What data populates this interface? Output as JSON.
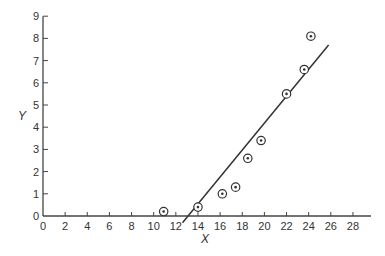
{
  "chart_data": {
    "type": "scatter",
    "title": "",
    "xlabel": "X",
    "ylabel": "Y",
    "xlim": [
      0,
      30
    ],
    "ylim": [
      0,
      9
    ],
    "xticks": [
      0,
      2,
      4,
      6,
      8,
      10,
      12,
      14,
      16,
      18,
      20,
      22,
      24,
      26,
      28
    ],
    "yticks": [
      0,
      1,
      2,
      3,
      4,
      5,
      6,
      7,
      8,
      9
    ],
    "grid": false,
    "legend": null,
    "series": [
      {
        "name": "data points",
        "marker": "circled-dot",
        "points": [
          {
            "x": 10.9,
            "y": 0.2
          },
          {
            "x": 14.0,
            "y": 0.4
          },
          {
            "x": 16.2,
            "y": 1.0
          },
          {
            "x": 17.4,
            "y": 1.3
          },
          {
            "x": 18.5,
            "y": 2.6
          },
          {
            "x": 19.7,
            "y": 3.4
          },
          {
            "x": 22.0,
            "y": 5.5
          },
          {
            "x": 23.6,
            "y": 6.6
          },
          {
            "x": 24.2,
            "y": 8.1
          }
        ]
      },
      {
        "name": "fitted line",
        "type": "line",
        "points": [
          {
            "x": 12.6,
            "y": -0.3
          },
          {
            "x": 25.8,
            "y": 7.7
          }
        ]
      }
    ]
  },
  "colors": {
    "axis": "#444444",
    "line": "#333333",
    "marker": "#333333"
  }
}
